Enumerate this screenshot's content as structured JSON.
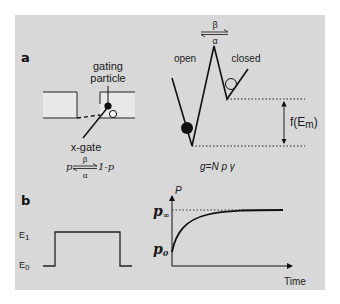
{
  "figure": {
    "background_color": "#d8d8d8",
    "line_color": "#111111",
    "membrane_fill": "#e8e8e8"
  },
  "panel_a": {
    "letter": "a",
    "gating_particle_label_line1": "gating",
    "gating_particle_label_line2": "particle",
    "x_gate_label": "x-gate",
    "equation": {
      "left": "p",
      "forward_rate": "β",
      "backward_rate": "α",
      "right": "1-p"
    },
    "energy_landscape": {
      "rate_top": "β",
      "rate_bottom": "α",
      "state_open": "open",
      "state_closed": "closed",
      "energy_difference_label": "f(E",
      "energy_difference_subscript": "m",
      "energy_difference_close": ")"
    },
    "conductance_equation": "g=N p γ"
  },
  "panel_b": {
    "letter": "b",
    "voltage_step": {
      "high_label": "E",
      "high_subscript": "1",
      "low_label": "E",
      "low_subscript": "0"
    },
    "probability_plot": {
      "y_axis_label": "P",
      "x_axis_label": "Time",
      "p_inf_label": "p",
      "p_inf_subscript": "∞",
      "p0_label": "p",
      "p0_subscript": "0"
    }
  }
}
